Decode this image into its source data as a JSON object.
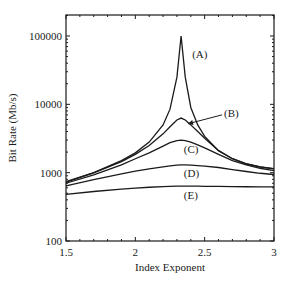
{
  "chart_data": {
    "type": "line",
    "title": "",
    "xlabel": "Index Exponent",
    "ylabel": "Bit Rate (Mb/s)",
    "xlim": [
      1.5,
      3
    ],
    "ylim": [
      100,
      200000
    ],
    "yscale": "log",
    "grid": false,
    "legend": "inline labels",
    "x_ticks": [
      1.5,
      2,
      2.5,
      3
    ],
    "x_tick_labels": [
      "1.5",
      "2",
      "2.5",
      "3"
    ],
    "y_ticks": [
      100,
      1000,
      10000,
      100000
    ],
    "y_tick_labels": [
      "100",
      "1000",
      "10000",
      "100000"
    ],
    "x": [
      1.5,
      1.7,
      1.9,
      2.0,
      2.1,
      2.2,
      2.25,
      2.3,
      2.33,
      2.36,
      2.4,
      2.45,
      2.5,
      2.6,
      2.7,
      2.8,
      2.9,
      3.0
    ],
    "series": [
      {
        "name": "(A)",
        "values": [
          740,
          1000,
          1500,
          1950,
          2800,
          5000,
          8500,
          25000,
          100000,
          25000,
          9000,
          5000,
          3400,
          2100,
          1600,
          1350,
          1220,
          1150
        ]
      },
      {
        "name": "(B)",
        "values": [
          730,
          990,
          1450,
          1850,
          2500,
          3700,
          4700,
          5900,
          6300,
          5900,
          5000,
          4000,
          3200,
          2100,
          1600,
          1340,
          1210,
          1140
        ]
      },
      {
        "name": "(C)",
        "values": [
          700,
          930,
          1300,
          1600,
          1950,
          2450,
          2750,
          2950,
          3000,
          2950,
          2800,
          2550,
          2300,
          1850,
          1500,
          1300,
          1160,
          1070
        ]
      },
      {
        "name": "(D)",
        "values": [
          640,
          790,
          960,
          1050,
          1140,
          1220,
          1260,
          1290,
          1300,
          1300,
          1290,
          1270,
          1250,
          1190,
          1110,
          1040,
          980,
          940
        ]
      },
      {
        "name": "(E)",
        "values": [
          480,
          530,
          575,
          595,
          612,
          625,
          630,
          635,
          636,
          636,
          635,
          634,
          632,
          628,
          625,
          622,
          620,
          618
        ]
      }
    ],
    "annotations": [
      {
        "text": "(A)",
        "x": 2.41,
        "y": 55000
      },
      {
        "text": "(B)",
        "x": 2.64,
        "y": 7500,
        "arrow_to": {
          "x": 2.38,
          "y": 5200
        }
      },
      {
        "text": "(C)",
        "x": 2.35,
        "y": 2200
      },
      {
        "text": "(D)",
        "x": 2.35,
        "y": 1000
      },
      {
        "text": "(E)",
        "x": 2.35,
        "y": 470
      }
    ]
  }
}
